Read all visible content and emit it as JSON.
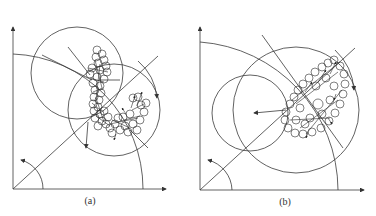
{
  "figure": {
    "panels": [
      {
        "id": "a",
        "caption": "(a)",
        "origin": [
          13,
          189
        ],
        "x_axis_end": 166,
        "y_axis_top": 27,
        "big_arc_radius": 132,
        "small_arc_radius": 30,
        "diagonal_end": [
          158,
          56
        ],
        "circles": [
          {
            "cx": 77,
            "cy": 73,
            "r": 46
          },
          {
            "cx": 114,
            "cy": 110,
            "r": 46
          }
        ],
        "cluster_shape": "hook / J-shaped trail of small circles with arrows"
      },
      {
        "id": "b",
        "caption": "(b)",
        "origin": [
          200,
          190
        ],
        "x_axis_end": 364,
        "y_axis_top": 27,
        "big_arc_radius": 150,
        "small_arc_radius": 32,
        "diagonal_end": [
          355,
          48
        ],
        "circles": [
          {
            "cx": 296,
            "cy": 110,
            "r": 63
          },
          {
            "cx": 250,
            "cy": 113,
            "r": 38
          }
        ],
        "cluster_shape": "elliptical ring of small circles with arrows"
      }
    ],
    "colors": {
      "line": "#3a3a3a",
      "background": "#ffffff"
    }
  }
}
